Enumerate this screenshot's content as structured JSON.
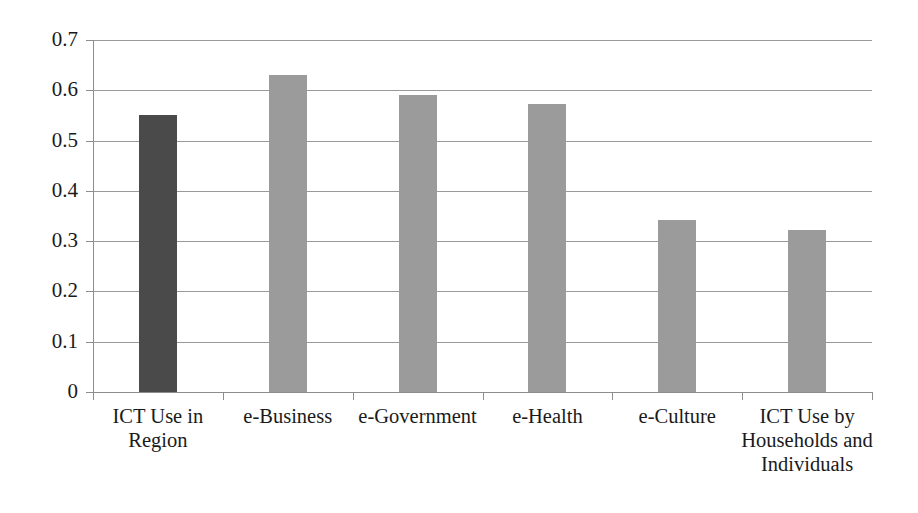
{
  "chart_data": {
    "type": "bar",
    "title": "",
    "subtitle": "",
    "xlabel": "",
    "ylabel": "",
    "ylim": [
      0,
      0.7
    ],
    "ytick_labels": [
      "0",
      "0.1",
      "0.2",
      "0.3",
      "0.4",
      "0.5",
      "0.6",
      "0.7"
    ],
    "ytick_values": [
      0,
      0.1,
      0.2,
      0.3,
      0.4,
      0.5,
      0.6,
      0.7
    ],
    "grid": "horizontal",
    "legend": "none",
    "categories": [
      "ICT Use in Region",
      "e-Business",
      "e-Government",
      "e-Health",
      "e-Culture",
      "ICT Use by Households and Individuals"
    ],
    "category_lines": [
      [
        "ICT Use in",
        "Region"
      ],
      [
        "e-Business"
      ],
      [
        "e-Government"
      ],
      [
        "e-Health"
      ],
      [
        "e-Culture"
      ],
      [
        "ICT Use by",
        "Households and",
        "Individuals"
      ]
    ],
    "values": [
      0.55,
      0.63,
      0.59,
      0.573,
      0.342,
      0.323
    ],
    "bar_colors": [
      "#4a4a4a",
      "#9b9b9b",
      "#9b9b9b",
      "#9b9b9b",
      "#9b9b9b",
      "#9b9b9b"
    ],
    "colors": {
      "highlight_bar": "#4a4a4a",
      "standard_bar": "#9b9b9b",
      "gridline": "#9a9a9a",
      "axis": "#8d8d8d",
      "text": "#1a1a1a",
      "background": "#ffffff"
    }
  }
}
